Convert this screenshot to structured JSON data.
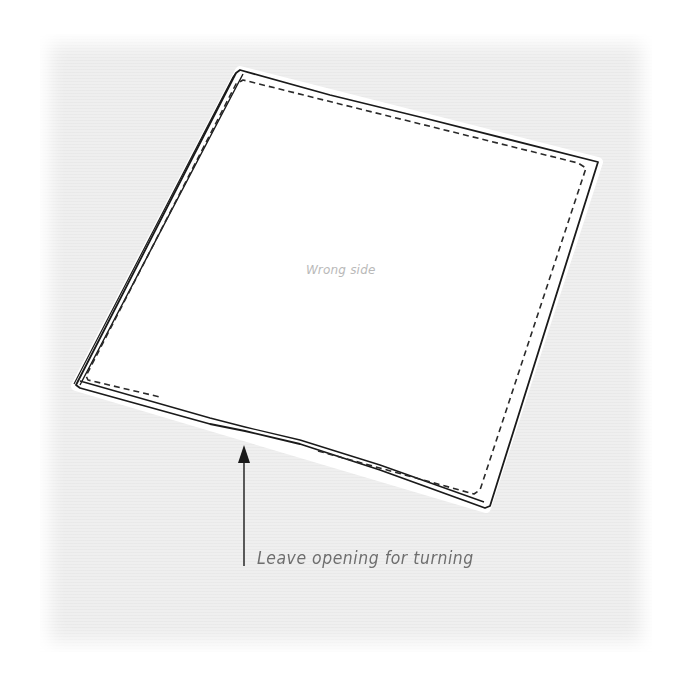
{
  "diagram": {
    "type": "sewing-instruction-illustration",
    "labels": {
      "center": "Wrong side",
      "callout": "Leave opening for turning"
    },
    "callout_target": "gap in stitching along bottom edge",
    "colors": {
      "background_texture": "#efefef",
      "fabric": "#ffffff",
      "outline": "#1a1a1a",
      "stitch_line": "#2a2a2a",
      "center_label": "#b9b9b9",
      "callout_label": "#6e6e6e"
    },
    "elements": [
      "fabric-square-outline",
      "dashed-stitch-line",
      "arrow-pointer",
      "center-label",
      "callout-label"
    ]
  }
}
